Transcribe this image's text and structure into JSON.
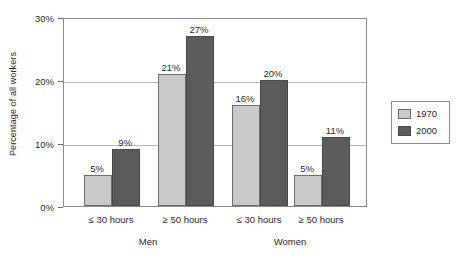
{
  "chart_data": {
    "type": "bar",
    "title": "",
    "xlabel": "",
    "ylabel": "Percentage of all workers",
    "ylim": [
      0,
      30
    ],
    "yticks": [
      0,
      10,
      20,
      30
    ],
    "ytick_labels": [
      "0%",
      "10%",
      "20%",
      "30%"
    ],
    "grid": true,
    "legend_position": "right",
    "group_labels": [
      "Men",
      "Women"
    ],
    "categories": [
      "≤ 30 hours",
      "≥ 50 hours",
      "≤ 30 hours",
      "≥ 50 hours"
    ],
    "category_groups": [
      "Men",
      "Men",
      "Women",
      "Women"
    ],
    "series": [
      {
        "name": "1970",
        "color": "#c9c9c9",
        "values": [
          5,
          21,
          16,
          5
        ],
        "value_labels": [
          "5%",
          "21%",
          "16%",
          "5%"
        ]
      },
      {
        "name": "2000",
        "color": "#5b5b5b",
        "values": [
          9,
          27,
          20,
          11
        ],
        "value_labels": [
          "9%",
          "27%",
          "20%",
          "11%"
        ]
      }
    ]
  },
  "legend": {
    "entries": [
      {
        "label": "1970",
        "color": "#c9c9c9"
      },
      {
        "label": "2000",
        "color": "#5b5b5b"
      }
    ]
  }
}
